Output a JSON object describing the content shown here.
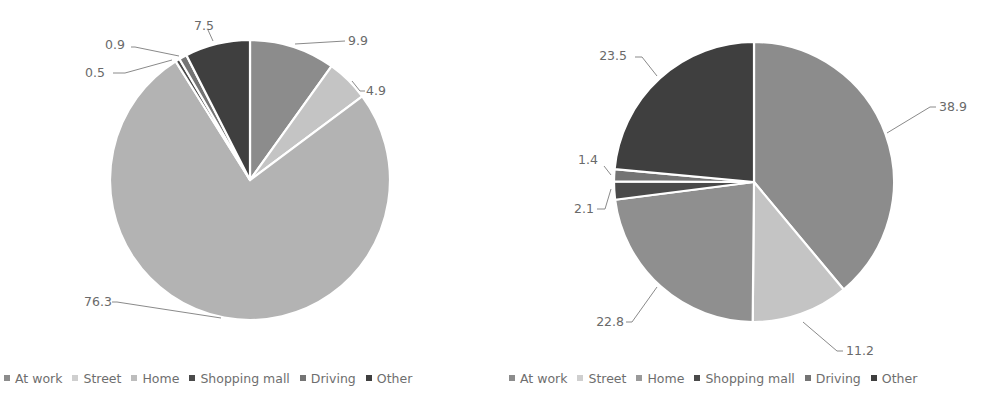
{
  "chart_data": [
    {
      "type": "pie",
      "title": "",
      "categories": [
        "At work",
        "Street",
        "Home",
        "Shopping mall",
        "Driving",
        "Other"
      ],
      "values": [
        9.9,
        4.9,
        76.3,
        0.5,
        0.9,
        7.5
      ],
      "colors": [
        "#8c8c8c",
        "#c4c4c4",
        "#b3b3b3",
        "#4a4a4a",
        "#747474",
        "#3f3f3f"
      ],
      "start_angle": "12 o'clock",
      "direction": "clockwise",
      "data_labels": [
        "9.9",
        "4.9",
        "76.3",
        "0.5",
        "0.9",
        "7.5"
      ],
      "legend_position": "bottom"
    },
    {
      "type": "pie",
      "title": "",
      "categories": [
        "At work",
        "Street",
        "Home",
        "Shopping mall",
        "Driving",
        "Other"
      ],
      "values": [
        38.9,
        11.2,
        22.8,
        2.1,
        1.4,
        23.5
      ],
      "colors": [
        "#8c8c8c",
        "#c4c4c4",
        "#8f8f8f",
        "#4a4a4a",
        "#747474",
        "#3f3f3f"
      ],
      "start_angle": "12 o'clock",
      "direction": "clockwise",
      "data_labels": [
        "38.9",
        "11.2",
        "22.8",
        "2.1",
        "1.4",
        "23.5"
      ],
      "legend_position": "bottom"
    }
  ],
  "left": {
    "legend": [
      {
        "label": "At work",
        "color": "#8c8c8c"
      },
      {
        "label": "Street",
        "color": "#cfcfcf"
      },
      {
        "label": "Home",
        "color": "#bdbdbd"
      },
      {
        "label": "Shopping mall",
        "color": "#4a4a4a"
      },
      {
        "label": "Driving",
        "color": "#747474"
      },
      {
        "label": "Other",
        "color": "#3f3f3f"
      }
    ]
  },
  "right": {
    "legend": [
      {
        "label": "At work",
        "color": "#8c8c8c"
      },
      {
        "label": "Street",
        "color": "#cfcfcf"
      },
      {
        "label": "Home",
        "color": "#9a9a9a"
      },
      {
        "label": "Shopping mall",
        "color": "#4a4a4a"
      },
      {
        "label": "Driving",
        "color": "#747474"
      },
      {
        "label": "Other",
        "color": "#3f3f3f"
      }
    ]
  }
}
